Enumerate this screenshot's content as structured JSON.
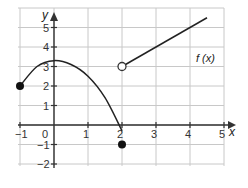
{
  "chart_data": {
    "type": "line",
    "title": "",
    "xlabel": "x",
    "ylabel": "y",
    "function_label": "f (x)",
    "xlim": [
      -1,
      5
    ],
    "ylim": [
      -2,
      5
    ],
    "grid": true,
    "x_ticks": [
      "-1",
      "0",
      "1",
      "2",
      "3",
      "4",
      "5"
    ],
    "y_ticks": [
      "5",
      "4",
      "3",
      "2",
      "1",
      "-1",
      "-2"
    ],
    "series": [
      {
        "name": "f(x) piece 1 (curve)",
        "kind": "curve",
        "points": [
          [
            -1,
            2
          ],
          [
            -0.5,
            3.0
          ],
          [
            0,
            3.3
          ],
          [
            0.5,
            3.1
          ],
          [
            1,
            2.5
          ],
          [
            1.5,
            1.4
          ],
          [
            2,
            -0.3
          ]
        ],
        "start_marker": "filled",
        "start_point": [
          -1,
          2
        ]
      },
      {
        "name": "f(x) isolated point",
        "kind": "point",
        "points": [
          [
            2,
            -1
          ]
        ],
        "marker": "filled"
      },
      {
        "name": "f(x) piece 2 (line)",
        "kind": "line",
        "points": [
          [
            2,
            3
          ],
          [
            4.5,
            5.5
          ]
        ],
        "start_marker": "open",
        "start_point": [
          2,
          3
        ]
      }
    ]
  },
  "colors": {
    "grid": "#c8c8c8",
    "axis": "#333333",
    "curve": "#222222"
  }
}
